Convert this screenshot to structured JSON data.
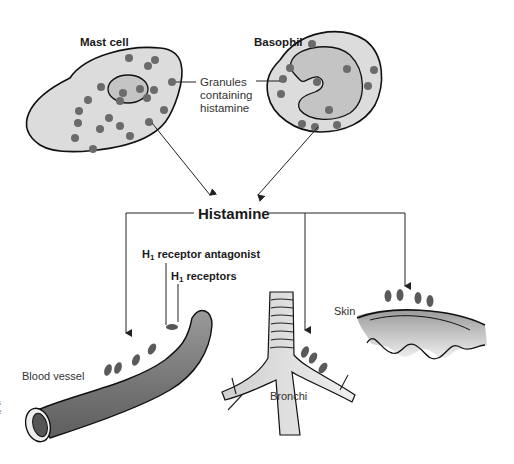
{
  "diagram": {
    "cells": [
      {
        "id": "mast-cell",
        "label": "Mast cell"
      },
      {
        "id": "basophil",
        "label": "Basophil"
      }
    ],
    "granules_label_line1": "Granules",
    "granules_label_line2": "containing",
    "granules_label_line3": "histamine",
    "center_label": "Histamine",
    "antagonist_label_prefix": "H",
    "antagonist_label_sub": "1",
    "antagonist_label_rest": " receptor antagonist",
    "receptors_label_prefix": "H",
    "receptors_label_sub": "1",
    "receptors_label_rest": " receptors",
    "targets": [
      {
        "id": "blood-vessel",
        "label": "Blood vessel"
      },
      {
        "id": "bronchi",
        "label": "Bronchi"
      },
      {
        "id": "skin",
        "label": "Skin"
      }
    ],
    "edge_fragment_line1": "s",
    "edge_fragment_line2": "e",
    "colors": {
      "cell_fill": "#d9d9d9",
      "granule": "#6b6b6b",
      "outline": "#111111",
      "vessel": "#8a8a8a",
      "arrow": "#222222"
    }
  }
}
